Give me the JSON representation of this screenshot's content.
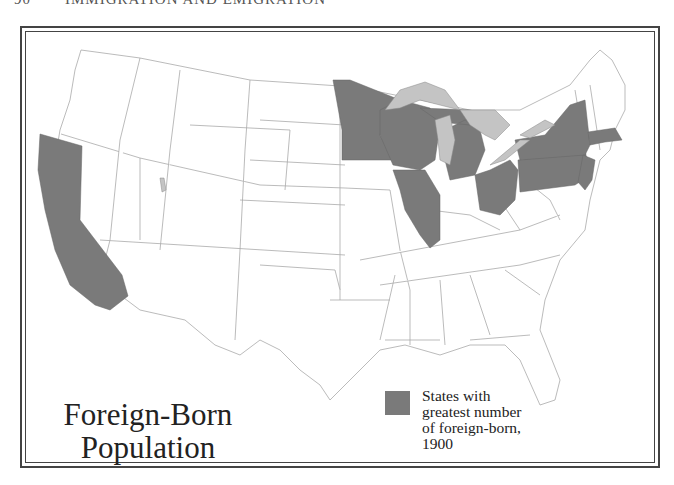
{
  "page_header": {
    "page_number": "90",
    "running_title": "IMMIGRATION AND EMIGRATION"
  },
  "map": {
    "title_line1": "Foreign-Born",
    "title_line2": "Population",
    "legend": {
      "swatch_color": "#7a7a7a",
      "label_lines": [
        "States with",
        "greatest number",
        "of foreign-born,",
        "1900"
      ]
    },
    "colors": {
      "highlighted_state": "#7a7a7a",
      "lake": "#c4c4c4",
      "state_fill": "#ffffff",
      "state_border": "#aaaaaa",
      "frame": "#444444"
    },
    "highlighted_states": [
      "California",
      "Minnesota",
      "Wisconsin",
      "Illinois",
      "Michigan",
      "Ohio",
      "Pennsylvania",
      "New York",
      "New Jersey",
      "Massachusetts"
    ],
    "great_lakes": [
      "Lake Superior",
      "Lake Michigan",
      "Lake Huron",
      "Lake Erie",
      "Lake Ontario"
    ]
  }
}
